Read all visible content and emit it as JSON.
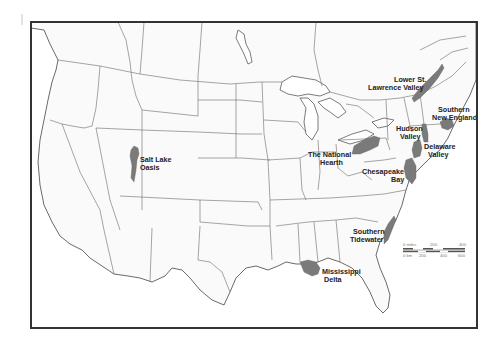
{
  "map": {
    "subject": "United States outline map with cultural hearth regions",
    "colors": {
      "region_fill": "#7a7a7a",
      "land_fill": "#fafafa",
      "border": "#6a6a6a",
      "frame": "#333333",
      "label": "#222222"
    },
    "regions": [
      {
        "id": "salt-lake-oasis",
        "label_line1": "Salt Lake",
        "label_line2": "Oasis"
      },
      {
        "id": "lower-st-lawrence-valley",
        "label_line1": "Lower St.",
        "label_line2": "Lawrence Valley"
      },
      {
        "id": "southern-new-england",
        "label_line1": "Southern",
        "label_line2": "New England"
      },
      {
        "id": "hudson-valley",
        "label_line1": "Hudson",
        "label_line2": "Valley"
      },
      {
        "id": "the-national-hearth",
        "label_line1": "The National",
        "label_line2": "Hearth"
      },
      {
        "id": "delaware-valley",
        "label_line1": "Delaware",
        "label_line2": "Valley"
      },
      {
        "id": "chesapeake-bay",
        "label_line1": "Chesapeake",
        "label_line2": "Bay"
      },
      {
        "id": "southern-tidewater",
        "label_line1": "Southern",
        "label_line2": "Tidewater"
      },
      {
        "id": "mississippi-delta",
        "label_line1": "Mississippi",
        "label_line2": "Delta"
      }
    ],
    "scale_bar": {
      "miles_label": "0 miles",
      "miles_ticks": [
        "200",
        "400"
      ],
      "km_label": "0 km",
      "km_ticks": [
        "200",
        "400",
        "600"
      ]
    }
  }
}
